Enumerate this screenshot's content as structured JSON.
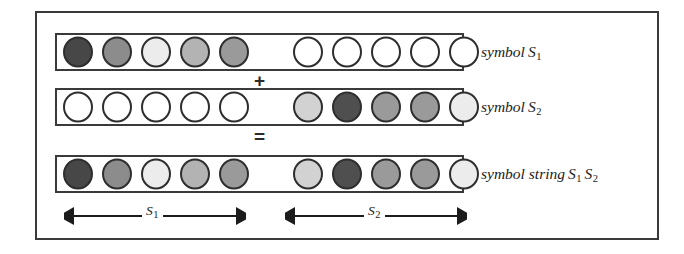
{
  "figure": {
    "caption_present": false,
    "background": "#ffffff",
    "frame_color": "#3a3a3a",
    "circle_outline_color": "#2e2e2e"
  },
  "palette": {
    "empty": "#ffffff",
    "very_dark": "#474747",
    "dark": "#4f4f4f",
    "medium_dark": "#8c8c8c",
    "medium": "#9a9a9a",
    "medium_light": "#b3b3b3",
    "light": "#d2d2d2",
    "very_light": "#ececec"
  },
  "operators": {
    "plus": "+",
    "equals": "="
  },
  "rows": [
    {
      "id": "row-1",
      "label_text": "symbol",
      "label_symbol": "S",
      "label_subscript": "1",
      "group_left": [
        "#474747",
        "#8c8c8c",
        "#ececec",
        "#b3b3b3",
        "#9a9a9a"
      ],
      "group_right": [
        "#ffffff",
        "#ffffff",
        "#ffffff",
        "#ffffff",
        "#ffffff"
      ]
    },
    {
      "id": "row-2",
      "label_text": "symbol",
      "label_symbol": "S",
      "label_subscript": "2",
      "group_left": [
        "#ffffff",
        "#ffffff",
        "#ffffff",
        "#ffffff",
        "#ffffff"
      ],
      "group_right": [
        "#d2d2d2",
        "#4f4f4f",
        "#9a9a9a",
        "#9a9a9a",
        "#ececec"
      ]
    },
    {
      "id": "row-3",
      "label_text": "symbol string",
      "label_symbol": "S",
      "label_subscript": "1",
      "label_symbol_2": "S",
      "label_subscript_2": "2",
      "group_left": [
        "#474747",
        "#8c8c8c",
        "#ececec",
        "#b3b3b3",
        "#9a9a9a"
      ],
      "group_right": [
        "#d2d2d2",
        "#4f4f4f",
        "#9a9a9a",
        "#9a9a9a",
        "#ececec"
      ]
    }
  ],
  "span_arrows": [
    {
      "id": "span-1",
      "symbol": "S",
      "subscript": "1",
      "style": "double-headed"
    },
    {
      "id": "span-2",
      "symbol": "S",
      "subscript": "2",
      "style": "double-headed"
    }
  ]
}
